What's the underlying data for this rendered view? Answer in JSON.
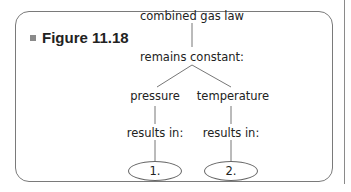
{
  "figure": {
    "label": "Figure 11.18",
    "bullet_color": "#8a8a8a",
    "border_color": "#7a7a7a"
  },
  "concept_map": {
    "root": "combined gas law",
    "level2": "remains constant:",
    "branches": [
      {
        "label": "pressure",
        "link": "results in:",
        "answer": "1."
      },
      {
        "label": "temperature",
        "link": "results in:",
        "answer": "2."
      }
    ]
  }
}
